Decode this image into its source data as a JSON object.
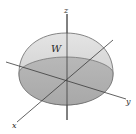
{
  "diagram": {
    "region_label": "W",
    "axes": {
      "x": "x",
      "y": "y",
      "z": "z"
    },
    "colors": {
      "dome_fill": "#d2d2d2",
      "base_fill": "#b4b4b4",
      "outline": "#6a6a6a",
      "axis": "#3a3a3a"
    }
  }
}
